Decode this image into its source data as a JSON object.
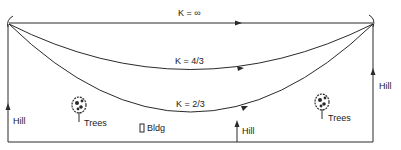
{
  "diagram": {
    "title": "",
    "paths": [
      {
        "id": "k_inf",
        "label": "K = ∞"
      },
      {
        "id": "k_4_3",
        "label": "K = 4/3"
      },
      {
        "id": "k_2_3",
        "label": "K = 2/3"
      }
    ],
    "obstacles": {
      "hill_left": "Hill",
      "trees_left": "Trees",
      "bldg": "Bldg",
      "hill_center": "Hill",
      "trees_right": "Trees",
      "hill_right": "Hill"
    },
    "colors": {
      "line": "#2a2a2a",
      "background": "#ffffff"
    }
  }
}
